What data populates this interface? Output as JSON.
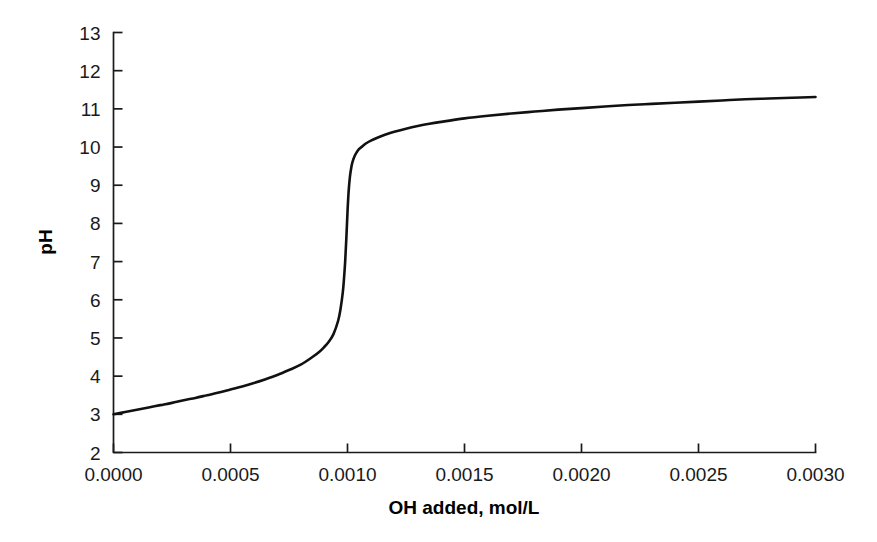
{
  "chart_data": {
    "type": "line",
    "title": "",
    "subtitle": "",
    "xlabel": "OH added, mol/L",
    "ylabel": "pH",
    "xlim": [
      0.0,
      0.003
    ],
    "ylim": [
      2,
      13
    ],
    "xticks": [
      "0.0000",
      "0.0005",
      "0.0010",
      "0.0015",
      "0.0020",
      "0.0025",
      "0.0030"
    ],
    "xtick_values": [
      0.0,
      0.0005,
      0.001,
      0.0015,
      0.002,
      0.0025,
      0.003
    ],
    "yticks": [
      "2",
      "3",
      "4",
      "5",
      "6",
      "7",
      "8",
      "9",
      "10",
      "11",
      "12",
      "13"
    ],
    "ytick_values": [
      2,
      3,
      4,
      5,
      6,
      7,
      8,
      9,
      10,
      11,
      12,
      13
    ],
    "grid": false,
    "legend": null,
    "legend_position": "none",
    "annotations": [],
    "series": [
      {
        "name": "titration curve",
        "color": "#111111",
        "x": [
          0.0,
          5e-05,
          0.0001,
          0.00015,
          0.0002,
          0.00025,
          0.0003,
          0.00035,
          0.0004,
          0.00045,
          0.0005,
          0.00055,
          0.0006,
          0.00065,
          0.0007,
          0.00075,
          0.0008,
          0.00085,
          0.00088,
          0.0009,
          0.00092,
          0.00094,
          0.00096,
          0.00097,
          0.00098,
          0.000985,
          0.00099,
          0.000995,
          0.001,
          0.001005,
          0.00101,
          0.001015,
          0.00102,
          0.00103,
          0.00104,
          0.00105,
          0.00106,
          0.00108,
          0.0011,
          0.00113,
          0.00116,
          0.0012,
          0.00125,
          0.0013,
          0.00135,
          0.0014,
          0.0015,
          0.0016,
          0.0017,
          0.0018,
          0.0019,
          0.002,
          0.0021,
          0.0022,
          0.0023,
          0.0024,
          0.0025,
          0.0026,
          0.0027,
          0.0028,
          0.0029,
          0.003
        ],
        "y": [
          3.0,
          3.06,
          3.12,
          3.18,
          3.24,
          3.3,
          3.37,
          3.43,
          3.5,
          3.57,
          3.65,
          3.73,
          3.82,
          3.92,
          4.03,
          4.16,
          4.3,
          4.5,
          4.64,
          4.76,
          4.9,
          5.1,
          5.45,
          5.75,
          6.2,
          6.55,
          7.0,
          7.6,
          8.3,
          8.85,
          9.2,
          9.42,
          9.58,
          9.76,
          9.87,
          9.95,
          10.0,
          10.1,
          10.17,
          10.25,
          10.32,
          10.4,
          10.48,
          10.55,
          10.61,
          10.66,
          10.75,
          10.82,
          10.88,
          10.93,
          10.98,
          11.02,
          11.06,
          11.1,
          11.13,
          11.16,
          11.19,
          11.22,
          11.25,
          11.27,
          11.29,
          11.31
        ]
      }
    ]
  },
  "figure": {
    "background_color": "#ffffff",
    "axis_color": "#1a1a1a",
    "curve_color": "#111111"
  }
}
